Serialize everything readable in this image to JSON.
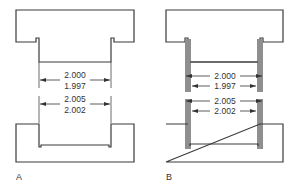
{
  "figures": [
    {
      "label": "A",
      "shaft": {
        "upper_limit": "2.000",
        "lower_limit": "1.997"
      },
      "hole": {
        "upper_limit": "2.005",
        "lower_limit": "2.002"
      },
      "gauge_shown": false
    },
    {
      "label": "B",
      "shaft": {
        "upper_limit": "2.000",
        "lower_limit": "1.997"
      },
      "hole": {
        "upper_limit": "2.005",
        "lower_limit": "2.002"
      },
      "gauge_shown": true
    }
  ],
  "colors": {
    "line": "#3a3a3a",
    "gauge_fill": "#8f8f8f",
    "background": "#ffffff"
  }
}
